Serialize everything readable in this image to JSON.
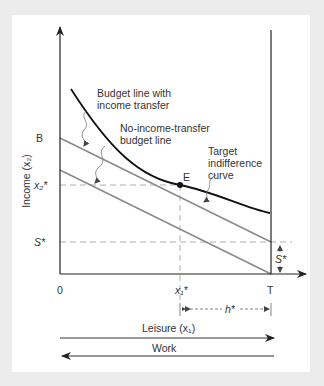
{
  "diagram": {
    "type": "economics-indifference-budget",
    "axes": {
      "y_label": "Income (x₂)",
      "x_label": "Leisure (x₁)",
      "origin": "0",
      "x_end": "T"
    },
    "y_ticks": {
      "b": "B",
      "x2_star": "x₂*",
      "s_star": "S*"
    },
    "x_ticks": {
      "x1_star": "x₁*"
    },
    "annotations": {
      "budget_transfer": [
        "Budget line with",
        "income transfer"
      ],
      "budget_no_transfer": [
        "No-income-transfer",
        "budget line"
      ],
      "indifference": [
        "Target",
        "indifference",
        "curve"
      ],
      "point_e": "E",
      "h_star": "h*",
      "s_star_right": "S*"
    },
    "arrows": {
      "leisure": "Leisure (x₁)",
      "work": "Work"
    },
    "colors": {
      "budget_lines": "#888888",
      "indifference_curve": "#111111",
      "axes": "#222222",
      "dashed": "#999999",
      "background": "#ececec",
      "panel": "#ffffff"
    }
  }
}
